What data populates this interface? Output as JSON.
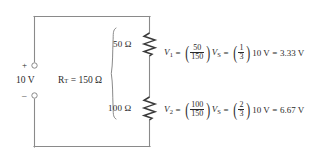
{
  "diagram": {
    "type": "circuit-schematic",
    "line_color": "#8a8a8a",
    "text_color": "#2a2a2a",
    "background": "#ffffff"
  },
  "source": {
    "plus_sign": "+",
    "minus_sign": "–",
    "voltage": "10 V",
    "terminal_style": "open-circle"
  },
  "total_resistance": {
    "symbol": "R",
    "subscript": "T",
    "equals": "=",
    "value": "150 Ω",
    "full_text": "R_T = 150 Ω"
  },
  "resistors": [
    {
      "id": "r1",
      "label": "50 Ω",
      "value": 50,
      "unit": "Ω"
    },
    {
      "id": "r2",
      "label": "100 Ω",
      "value": 100,
      "unit": "Ω"
    }
  ],
  "equations": [
    {
      "id": "v1",
      "lhs_symbol": "V",
      "lhs_sub": "1",
      "eq1": "=",
      "frac1_num": "50",
      "frac1_den": "150",
      "vs_symbol": "V",
      "vs_sub": "S",
      "eq2": "=",
      "frac2_num": "1",
      "frac2_den": "3",
      "source_term": "10 V",
      "eq3": "=",
      "result": "3.33 V",
      "plain": "V1 = (50/150)VS = (1/3)10 V = 3.33 V"
    },
    {
      "id": "v2",
      "lhs_symbol": "V",
      "lhs_sub": "2",
      "eq1": "=",
      "frac1_num": "100",
      "frac1_den": "150",
      "vs_symbol": "V",
      "vs_sub": "S",
      "eq2": "=",
      "frac2_num": "2",
      "frac2_den": "3",
      "source_term": "10 V",
      "eq3": "=",
      "result": "6.67 V",
      "plain": "V2 = (100/150)VS = (2/3)10 V = 6.67 V"
    }
  ]
}
